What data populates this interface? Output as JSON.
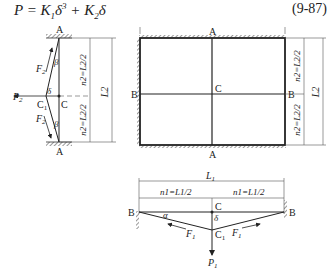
{
  "formula": {
    "text_parts": [
      "P = K",
      "1",
      "δ",
      "3",
      " + K",
      "2",
      "δ"
    ],
    "equation_number": "(9-87)"
  },
  "left_diagram": {
    "labels": {
      "top_support": "A",
      "bottom_support": "A",
      "load": "P2",
      "point_c": "C",
      "point_c1": "C1",
      "deflection": "δ",
      "force_upper": "F2",
      "force_lower": "F2",
      "angle_upper": "β",
      "angle_lower": "β"
    },
    "dimensions": {
      "upper_half": "n2=L2/2",
      "lower_half": "n2=L2/2",
      "total": "L2"
    }
  },
  "plate_diagram": {
    "labels": {
      "top": "A",
      "bottom": "A",
      "left": "B",
      "right": "B",
      "center": "C"
    },
    "dimensions": {
      "upper_half": "n2=L2/2",
      "lower_half": "n2=L2/2",
      "total": "L2"
    }
  },
  "bottom_diagram": {
    "labels": {
      "left_support": "B",
      "right_support": "B",
      "point_c": "C",
      "point_c1": "C1",
      "deflection": "δ",
      "angle": "α",
      "force_left": "F1",
      "force_right": "F1",
      "load": "P1"
    },
    "dimensions": {
      "total": "L1",
      "left_half": "n1=L1/2",
      "right_half": "n1=L1/2"
    }
  }
}
